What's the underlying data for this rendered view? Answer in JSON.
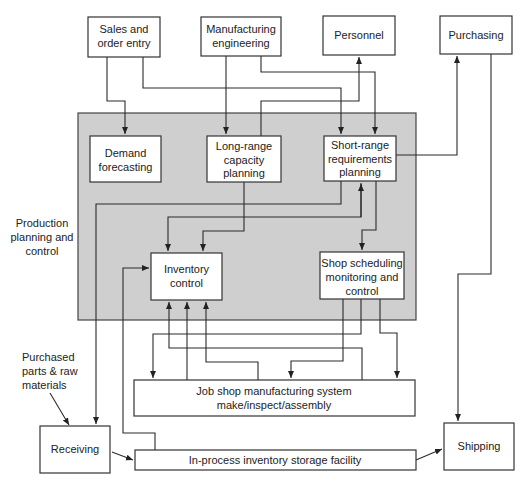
{
  "diagram": {
    "region": {
      "label": [
        "Production",
        "planning and",
        "control"
      ]
    },
    "nodes": {
      "sales": [
        "Sales and",
        "order entry"
      ],
      "mfg_eng": [
        "Manufacturing",
        "engineering"
      ],
      "personnel": [
        "Personnel"
      ],
      "purchasing": [
        "Purchasing"
      ],
      "demand": [
        "Demand",
        "forecasting"
      ],
      "long_range": [
        "Long-range",
        "capacity",
        "planning"
      ],
      "short_range": [
        "Short-range",
        "requirements",
        "planning"
      ],
      "inventory": [
        "Inventory",
        "control"
      ],
      "shop_sched": [
        "Shop scheduling",
        "monitoring and",
        "control"
      ],
      "job_shop": [
        "Job shop manufacturing system",
        "make/inspect/assembly"
      ],
      "receiving": [
        "Receiving"
      ],
      "in_process": [
        "In-process inventory storage facility"
      ],
      "shipping": [
        "Shipping"
      ]
    },
    "annotation": [
      "Purchased",
      "parts & raw",
      "materials"
    ]
  }
}
